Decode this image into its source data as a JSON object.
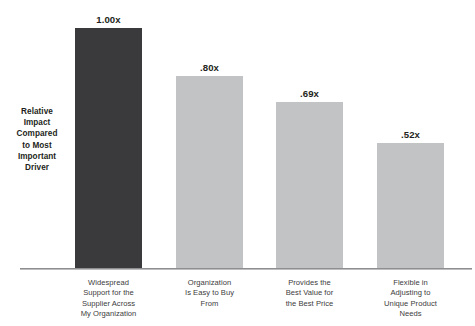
{
  "chart_data": {
    "type": "bar",
    "title": "",
    "subtitle": "",
    "xlabel": "",
    "ylabel": "Relative Impact Compared to Most Important Driver",
    "ylim": [
      0,
      1.0
    ],
    "grid": false,
    "legend": null,
    "categories": [
      "Widespread Support for the Supplier Across My Organization",
      "Organization Is Easy to Buy From",
      "Provides the Best Value for the Best Price",
      "Flexible in Adjusting to Unique Product Needs"
    ],
    "values": [
      1.0,
      0.8,
      0.69,
      0.52
    ],
    "value_labels": [
      "1.00x",
      ".80x",
      ".69x",
      ".52x"
    ],
    "bar_colors": [
      "#3a3a3c",
      "#c2c3c4",
      "#c2c3c4",
      "#c2c3c4"
    ],
    "bars": [
      {
        "value": 1.0,
        "value_label": "1.00x",
        "color": "#3a3a3c",
        "label_lines": [
          "Widespread",
          "Support for the",
          "Supplier Across",
          "My Organization"
        ]
      },
      {
        "value": 0.8,
        "value_label": ".80x",
        "color": "#c2c3c4",
        "label_lines": [
          "Organization",
          "Is Easy to Buy",
          "From"
        ]
      },
      {
        "value": 0.69,
        "value_label": ".69x",
        "color": "#c2c3c4",
        "label_lines": [
          "Provides the",
          "Best Value for",
          "the Best Price"
        ]
      },
      {
        "value": 0.52,
        "value_label": ".52x",
        "color": "#c2c3c4",
        "label_lines": [
          "Flexible in",
          "Adjusting to",
          "Unique Product",
          "Needs"
        ]
      }
    ]
  },
  "y_axis_caption_lines": [
    "Relative",
    "Impact",
    "Compared",
    "to Most",
    "Important",
    "Driver"
  ],
  "colors": {
    "highlight_bar": "#3a3a3c",
    "normal_bar": "#c2c3c4",
    "axis_line": "#8e8e90",
    "text": "#231f20",
    "label_text": "#3c3c3c",
    "background": "#ffffff"
  }
}
